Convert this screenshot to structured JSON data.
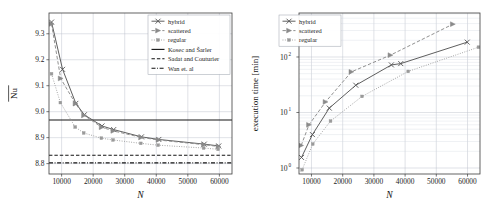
{
  "figure": {
    "panels": [
      "convergence-plot",
      "execution-time-plot"
    ]
  },
  "chart_data": [
    {
      "id": "convergence-plot",
      "type": "line",
      "title": "",
      "xlabel": "N",
      "ylabel": "Nu",
      "ylabel_overline": true,
      "xscale": "linear",
      "yscale": "linear",
      "xlim": [
        6000,
        64000
      ],
      "ylim": [
        8.76,
        9.38
      ],
      "xticks": [
        10000,
        20000,
        30000,
        40000,
        50000,
        60000
      ],
      "xtick_labels": [
        "10000",
        "20000",
        "30000",
        "40000",
        "50000",
        "60000"
      ],
      "yticks": [
        8.8,
        8.9,
        9.0,
        9.1,
        9.2,
        9.3
      ],
      "ytick_labels": [
        "8.8",
        "8.9",
        "9.0",
        "9.1",
        "9.2",
        "9.3"
      ],
      "grid": true,
      "legend_position": "upper right",
      "series": [
        {
          "name": "hybrid",
          "marker": "x",
          "linestyle": "solid",
          "color": "#555555",
          "x": [
            6800,
            10300,
            14500,
            17200,
            22800,
            26500,
            35300,
            40800,
            55200,
            59800
          ],
          "y": [
            9.345,
            9.163,
            9.032,
            8.988,
            8.945,
            8.931,
            8.903,
            8.893,
            8.875,
            8.868
          ]
        },
        {
          "name": "scattered",
          "marker": "triangle-right",
          "linestyle": "dashed",
          "color": "#8a8a8a",
          "x": [
            6800,
            9700,
            14400,
            17100,
            22700,
            26400,
            35200,
            40700,
            55100,
            59700
          ],
          "y": [
            9.338,
            9.128,
            9.031,
            8.986,
            8.94,
            8.926,
            8.901,
            8.891,
            8.873,
            8.866
          ]
        },
        {
          "name": "regular",
          "marker": "dot",
          "linestyle": "dotted",
          "color": "#9a9a9a",
          "x": [
            6800,
            9600,
            14300,
            17000,
            22600,
            26300,
            35100,
            40600,
            55000,
            59600
          ],
          "y": [
            9.146,
            9.035,
            8.941,
            8.918,
            8.898,
            8.891,
            8.878,
            8.871,
            8.86,
            8.855
          ]
        }
      ],
      "reference_lines": [
        {
          "name": "Kosec and Šarler",
          "value": 8.968,
          "linestyle": "solid",
          "color": "#111111"
        },
        {
          "name": "Sadat and Couturier",
          "value": 8.832,
          "linestyle": "dashed",
          "color": "#111111"
        },
        {
          "name": "Wan et. al",
          "value": 8.803,
          "linestyle": "dashdot",
          "color": "#111111"
        }
      ],
      "legend_entries": [
        {
          "label": "hybrid",
          "marker": "x",
          "linestyle": "solid",
          "color": "#555555"
        },
        {
          "label": "scattered",
          "marker": "triangle-right",
          "linestyle": "dashed",
          "color": "#8a8a8a"
        },
        {
          "label": "regular",
          "marker": "dot",
          "linestyle": "dotted",
          "color": "#9a9a9a"
        },
        {
          "label": "Kosec and Šarler",
          "marker": "none",
          "linestyle": "solid",
          "color": "#111111"
        },
        {
          "label": "Sadat and Couturier",
          "marker": "none",
          "linestyle": "dashed",
          "color": "#111111"
        },
        {
          "label": "Wan et. al",
          "marker": "none",
          "linestyle": "dashdot",
          "color": "#111111"
        }
      ]
    },
    {
      "id": "execution-time-plot",
      "type": "line",
      "title": "",
      "xlabel": "N",
      "ylabel": "execution time [min]",
      "xscale": "linear",
      "yscale": "log",
      "xlim": [
        6000,
        64000
      ],
      "ylim": [
        0.78,
        620
      ],
      "xticks": [
        10000,
        20000,
        30000,
        40000,
        50000,
        60000
      ],
      "xtick_labels": [
        "10000",
        "20000",
        "30000",
        "40000",
        "50000",
        "60000"
      ],
      "yticks": [
        1,
        10,
        100
      ],
      "ytick_labels": [
        "10⁰",
        "10¹",
        "10²"
      ],
      "ytick_bases": [
        "10",
        "10",
        "10"
      ],
      "ytick_exponents": [
        "0",
        "1",
        "2"
      ],
      "grid": true,
      "legend_position": "upper left",
      "series": [
        {
          "name": "hybrid",
          "marker": "x",
          "linestyle": "solid",
          "color": "#555555",
          "x": [
            6800,
            10300,
            15700,
            24200,
            35600,
            38600,
            59900
          ],
          "y": [
            1.55,
            4.0,
            12.0,
            31.0,
            72.0,
            76.0,
            185.0
          ]
        },
        {
          "name": "scattered",
          "marker": "triangle-right",
          "linestyle": "dashed",
          "color": "#8a8a8a",
          "x": [
            6700,
            9200,
            14500,
            22800,
            35300,
            55300
          ],
          "y": [
            2.55,
            6.0,
            15.5,
            54.0,
            108.0,
            390.0
          ]
        },
        {
          "name": "regular",
          "marker": "dot",
          "linestyle": "dotted",
          "color": "#9a9a9a",
          "x": [
            7000,
            10400,
            16100,
            26200,
            41000,
            63500
          ],
          "y": [
            0.93,
            2.7,
            7.0,
            19.5,
            55.0,
            150.0
          ]
        }
      ],
      "legend_entries": [
        {
          "label": "hybrid",
          "marker": "x",
          "linestyle": "solid",
          "color": "#555555"
        },
        {
          "label": "scattered",
          "marker": "triangle-right",
          "linestyle": "dashed",
          "color": "#8a8a8a"
        },
        {
          "label": "regular",
          "marker": "dot",
          "linestyle": "dotted",
          "color": "#9a9a9a"
        }
      ]
    }
  ]
}
